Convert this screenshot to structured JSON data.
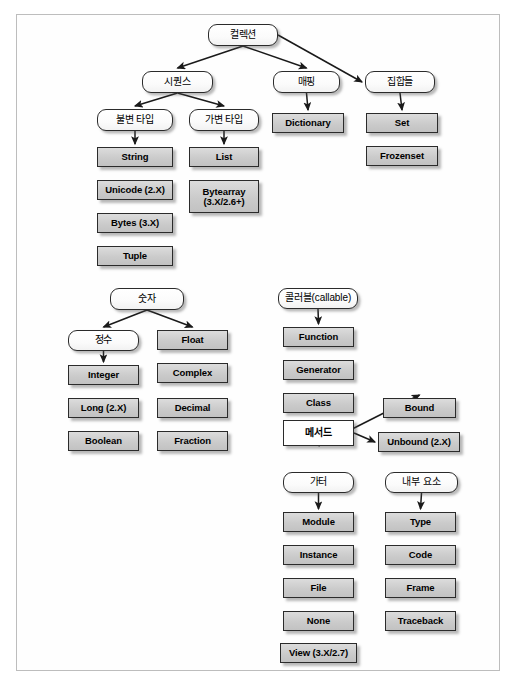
{
  "diagram": {
    "frame": {
      "border_color": "#bdbdbd"
    },
    "colors": {
      "node_fill": "#cfcfcf",
      "node_border": "#2b2b2b",
      "rounded_fill": "#ffffff",
      "arrow": "#1a1a1a"
    },
    "groups": [
      {
        "name": "collections",
        "root": "컬렉션",
        "branches": [
          "시퀀스",
          "매핑",
          "집합들"
        ]
      },
      {
        "name": "numbers",
        "root": "숫자",
        "branches": [
          "정수",
          "Float"
        ]
      },
      {
        "name": "callables",
        "root": "콜러블(callable)",
        "branches": [
          "Function"
        ]
      },
      {
        "name": "others",
        "root": "가터",
        "branches": [
          "Module"
        ]
      },
      {
        "name": "internals",
        "root": "내부 요소",
        "branches": [
          "Type"
        ]
      }
    ],
    "nodes": [
      {
        "id": "collection",
        "label": "컬렉션",
        "shape": "rounded",
        "lang": "ko",
        "x": 208,
        "y": 24,
        "w": 70,
        "h": 22
      },
      {
        "id": "sequence",
        "label": "시퀀스",
        "shape": "rounded",
        "lang": "ko",
        "x": 142,
        "y": 71,
        "w": 71,
        "h": 22
      },
      {
        "id": "mapping",
        "label": "매핑",
        "shape": "rounded",
        "lang": "ko",
        "x": 273,
        "y": 71,
        "w": 67,
        "h": 22
      },
      {
        "id": "sets",
        "label": "집합들",
        "shape": "rounded",
        "lang": "ko",
        "x": 365,
        "y": 71,
        "w": 70,
        "h": 22
      },
      {
        "id": "immutable",
        "label": "불변 타입",
        "shape": "rounded",
        "lang": "ko",
        "x": 97,
        "y": 109,
        "w": 76,
        "h": 22
      },
      {
        "id": "mutable",
        "label": "가변 타입",
        "shape": "rounded",
        "lang": "ko",
        "x": 189,
        "y": 109,
        "w": 70,
        "h": 22
      },
      {
        "id": "dictionary",
        "label": "Dictionary",
        "shape": "rect",
        "lang": "en",
        "x": 272,
        "y": 113,
        "w": 72,
        "h": 20
      },
      {
        "id": "set",
        "label": "Set",
        "shape": "rect",
        "lang": "en",
        "x": 366,
        "y": 113,
        "w": 72,
        "h": 20
      },
      {
        "id": "frozenset",
        "label": "Frozenset",
        "shape": "rect",
        "lang": "en",
        "x": 366,
        "y": 146,
        "w": 72,
        "h": 20
      },
      {
        "id": "string",
        "label": "String",
        "shape": "rect",
        "lang": "en",
        "x": 97,
        "y": 147,
        "w": 76,
        "h": 20
      },
      {
        "id": "unicode",
        "label": "Unicode  (2.X)",
        "shape": "rect",
        "lang": "en",
        "x": 97,
        "y": 180,
        "w": 76,
        "h": 20
      },
      {
        "id": "bytes",
        "label": "Bytes (3.X)",
        "shape": "rect",
        "lang": "en",
        "x": 97,
        "y": 213,
        "w": 76,
        "h": 20
      },
      {
        "id": "tuple",
        "label": "Tuple",
        "shape": "rect",
        "lang": "en",
        "x": 97,
        "y": 246,
        "w": 76,
        "h": 20
      },
      {
        "id": "list",
        "label": "List",
        "shape": "rect",
        "lang": "en",
        "x": 189,
        "y": 147,
        "w": 70,
        "h": 20
      },
      {
        "id": "bytearray",
        "label": "Bytearray\n(3.X/2.6+)",
        "shape": "rect",
        "lang": "en",
        "x": 189,
        "y": 180,
        "w": 70,
        "h": 33
      },
      {
        "id": "numbers",
        "label": "숫자",
        "shape": "rounded",
        "lang": "ko",
        "x": 110,
        "y": 288,
        "w": 74,
        "h": 22
      },
      {
        "id": "integers",
        "label": "정수",
        "shape": "rounded",
        "lang": "ko",
        "x": 68,
        "y": 330,
        "w": 71,
        "h": 21
      },
      {
        "id": "integer",
        "label": "Integer",
        "shape": "rect",
        "lang": "en",
        "x": 68,
        "y": 365,
        "w": 71,
        "h": 20
      },
      {
        "id": "long",
        "label": "Long (2.X)",
        "shape": "rect",
        "lang": "en",
        "x": 68,
        "y": 398,
        "w": 71,
        "h": 20
      },
      {
        "id": "boolean",
        "label": "Boolean",
        "shape": "rect",
        "lang": "en",
        "x": 68,
        "y": 431,
        "w": 71,
        "h": 20
      },
      {
        "id": "float",
        "label": "Float",
        "shape": "rect",
        "lang": "en",
        "x": 157,
        "y": 330,
        "w": 71,
        "h": 20
      },
      {
        "id": "complex",
        "label": "Complex",
        "shape": "rect",
        "lang": "en",
        "x": 157,
        "y": 363,
        "w": 71,
        "h": 20
      },
      {
        "id": "decimal",
        "label": "Decimal",
        "shape": "rect",
        "lang": "en",
        "x": 157,
        "y": 398,
        "w": 71,
        "h": 20
      },
      {
        "id": "fraction",
        "label": "Fraction",
        "shape": "rect",
        "lang": "en",
        "x": 157,
        "y": 431,
        "w": 71,
        "h": 20
      },
      {
        "id": "callable",
        "label": "콜러블(callable)",
        "shape": "rounded",
        "lang": "ko",
        "x": 278,
        "y": 288,
        "w": 80,
        "h": 21
      },
      {
        "id": "function",
        "label": "Function",
        "shape": "rect",
        "lang": "en",
        "x": 283,
        "y": 327,
        "w": 71,
        "h": 20
      },
      {
        "id": "generator",
        "label": "Generator",
        "shape": "rect",
        "lang": "en",
        "x": 283,
        "y": 360,
        "w": 71,
        "h": 20
      },
      {
        "id": "class",
        "label": "Class",
        "shape": "rect",
        "lang": "en",
        "x": 283,
        "y": 393,
        "w": 71,
        "h": 20
      },
      {
        "id": "method",
        "label": "메서드",
        "shape": "white",
        "lang": "ko",
        "x": 283,
        "y": 420,
        "w": 71,
        "h": 26
      },
      {
        "id": "bound",
        "label": "Bound",
        "shape": "rect",
        "lang": "en",
        "x": 383,
        "y": 398,
        "w": 73,
        "h": 20
      },
      {
        "id": "unbound",
        "label": "Unbound (2.X)",
        "shape": "rect",
        "lang": "en",
        "x": 378,
        "y": 432,
        "w": 82,
        "h": 20
      },
      {
        "id": "others",
        "label": "가터",
        "shape": "rounded",
        "lang": "ko",
        "x": 283,
        "y": 472,
        "w": 71,
        "h": 21
      },
      {
        "id": "module",
        "label": "Module",
        "shape": "rect",
        "lang": "en",
        "x": 283,
        "y": 512,
        "w": 71,
        "h": 20
      },
      {
        "id": "instance",
        "label": "Instance",
        "shape": "rect",
        "lang": "en",
        "x": 283,
        "y": 545,
        "w": 71,
        "h": 20
      },
      {
        "id": "file",
        "label": "File",
        "shape": "rect",
        "lang": "en",
        "x": 283,
        "y": 578,
        "w": 71,
        "h": 20
      },
      {
        "id": "none",
        "label": "None",
        "shape": "rect",
        "lang": "en",
        "x": 283,
        "y": 611,
        "w": 71,
        "h": 20
      },
      {
        "id": "view",
        "label": "View (3.X/2.7)",
        "shape": "rect",
        "lang": "en",
        "x": 280,
        "y": 643,
        "w": 77,
        "h": 20
      },
      {
        "id": "internals",
        "label": "내부 요소",
        "shape": "rounded",
        "lang": "ko",
        "x": 385,
        "y": 472,
        "w": 73,
        "h": 21
      },
      {
        "id": "type",
        "label": "Type",
        "shape": "rect",
        "lang": "en",
        "x": 385,
        "y": 512,
        "w": 71,
        "h": 20
      },
      {
        "id": "code",
        "label": "Code",
        "shape": "rect",
        "lang": "en",
        "x": 385,
        "y": 545,
        "w": 71,
        "h": 20
      },
      {
        "id": "frame",
        "label": "Frame",
        "shape": "rect",
        "lang": "en",
        "x": 385,
        "y": 578,
        "w": 71,
        "h": 20
      },
      {
        "id": "traceback",
        "label": "Traceback",
        "shape": "rect",
        "lang": "en",
        "x": 385,
        "y": 611,
        "w": 71,
        "h": 20
      }
    ],
    "edges": [
      {
        "from": "collection",
        "to": "sequence"
      },
      {
        "from": "collection",
        "to": "mapping"
      },
      {
        "from": "collection",
        "to": "sets"
      },
      {
        "from": "sequence",
        "to": "immutable"
      },
      {
        "from": "sequence",
        "to": "mutable"
      },
      {
        "from": "mapping",
        "to": "dictionary"
      },
      {
        "from": "sets",
        "to": "set"
      },
      {
        "from": "immutable",
        "to": "string"
      },
      {
        "from": "mutable",
        "to": "list"
      },
      {
        "from": "numbers",
        "to": "integers"
      },
      {
        "from": "numbers",
        "to": "float"
      },
      {
        "from": "integers",
        "to": "integer"
      },
      {
        "from": "callable",
        "to": "function"
      },
      {
        "from": "method",
        "to": "bound"
      },
      {
        "from": "method",
        "to": "unbound"
      },
      {
        "from": "others",
        "to": "module"
      },
      {
        "from": "internals",
        "to": "type"
      }
    ]
  }
}
